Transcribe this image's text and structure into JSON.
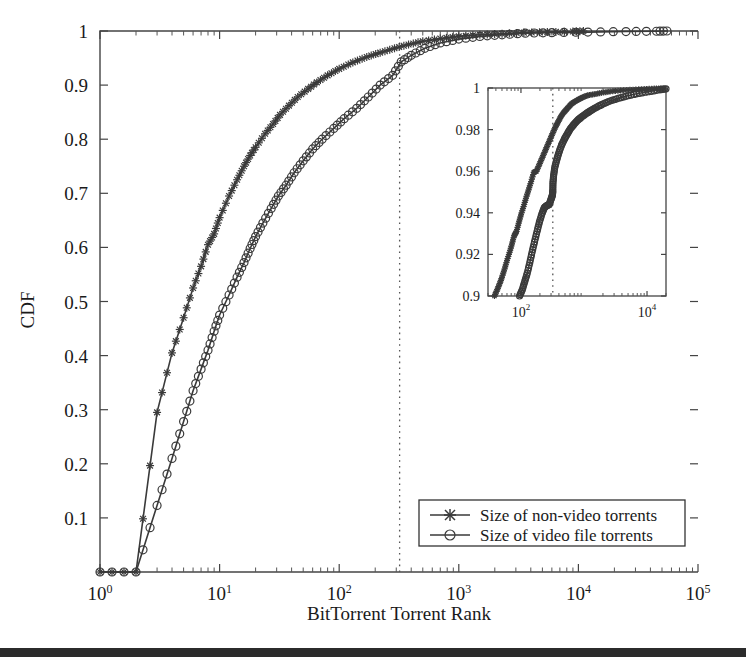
{
  "figure": {
    "background_color": "#ffffff",
    "line_color": "#3a3a3a",
    "axis_color": "#444444",
    "scan_bar": {
      "top": 648,
      "height": 9,
      "color": "#2b2b2b"
    }
  },
  "chart_data": {
    "type": "line",
    "title": "",
    "xlabel": "BitTorrent Torrent Rank",
    "ylabel": "CDF",
    "xscale": "log",
    "yscale": "linear",
    "xlim": [
      1,
      100000
    ],
    "ylim": [
      0,
      1
    ],
    "grid": false,
    "xtick_labels": [
      "10^0",
      "10^1",
      "10^2",
      "10^3",
      "10^4",
      "10^5"
    ],
    "xtick_values": [
      1,
      10,
      100,
      1000,
      10000,
      100000
    ],
    "ytick_labels": [
      "0.1",
      "0.2",
      "0.3",
      "0.4",
      "0.5",
      "0.6",
      "0.7",
      "0.8",
      "0.9",
      "1"
    ],
    "ytick_values": [
      0.1,
      0.2,
      0.3,
      0.4,
      0.5,
      0.6,
      0.7,
      0.8,
      0.9,
      1.0
    ],
    "legend_position": "lower right",
    "annotations": [
      {
        "name": "vertical-dotted-guide",
        "type": "vline",
        "x": 320
      }
    ],
    "series": [
      {
        "name": "Size of non-video torrents",
        "marker": "star",
        "x": [
          1,
          2,
          3,
          4,
          5,
          6,
          7,
          8,
          9,
          10,
          12,
          14,
          16,
          18,
          20,
          24,
          28,
          32,
          38,
          45,
          55,
          65,
          80,
          100,
          130,
          170,
          220,
          290,
          380,
          500,
          700,
          1000,
          1500,
          2300,
          3500,
          5500,
          9000,
          11000
        ],
        "y": [
          0.0,
          0.0,
          0.295,
          0.405,
          0.47,
          0.525,
          0.565,
          0.605,
          0.625,
          0.655,
          0.695,
          0.725,
          0.75,
          0.77,
          0.785,
          0.81,
          0.828,
          0.845,
          0.862,
          0.878,
          0.893,
          0.905,
          0.918,
          0.93,
          0.942,
          0.952,
          0.96,
          0.968,
          0.975,
          0.981,
          0.986,
          0.99,
          0.993,
          0.995,
          0.997,
          0.998,
          0.999,
          1.0
        ]
      },
      {
        "name": "Size of video file torrents",
        "marker": "circle",
        "x": [
          1,
          2,
          3,
          4,
          5,
          6,
          7,
          8,
          9,
          10,
          12,
          14,
          16,
          18,
          20,
          23,
          27,
          31,
          36,
          42,
          50,
          60,
          72,
          90,
          110,
          140,
          175,
          220,
          280,
          330,
          400,
          520,
          700,
          1000,
          1500,
          2300,
          3600,
          6000,
          12000,
          25000,
          45000,
          55000
        ],
        "y": [
          0.0,
          0.0,
          0.123,
          0.21,
          0.278,
          0.335,
          0.375,
          0.41,
          0.445,
          0.475,
          0.512,
          0.545,
          0.572,
          0.598,
          0.62,
          0.645,
          0.672,
          0.695,
          0.715,
          0.738,
          0.76,
          0.782,
          0.8,
          0.82,
          0.838,
          0.857,
          0.878,
          0.9,
          0.918,
          0.943,
          0.955,
          0.968,
          0.978,
          0.985,
          0.99,
          0.993,
          0.996,
          0.997,
          0.998,
          0.999,
          0.9995,
          1.0
        ]
      }
    ],
    "inset": {
      "xlabel": "",
      "ylabel": "",
      "xscale": "log",
      "xlim": [
        30,
        20000
      ],
      "ylim": [
        0.9,
        1.0
      ],
      "xtick_labels": [
        "10^2",
        "10^4"
      ],
      "xtick_values": [
        100,
        10000
      ],
      "ytick_labels": [
        "0.9",
        "0.92",
        "0.94",
        "0.96",
        "0.98",
        "1"
      ],
      "ytick_values": [
        0.9,
        0.92,
        0.94,
        0.96,
        0.98,
        1.0
      ],
      "annotations": [
        {
          "name": "vertical-dotted-guide",
          "type": "vline",
          "x": 320
        }
      ],
      "series": [
        {
          "name": "Size of non-video torrents",
          "marker": "star",
          "x": [
            38,
            42,
            46,
            50,
            55,
            60,
            66,
            72,
            78,
            85,
            92,
            100,
            110,
            120,
            132,
            145,
            160,
            176,
            194,
            214,
            236,
            260,
            287,
            316,
            349,
            385,
            425,
            470,
            520,
            575,
            640,
            720,
            820,
            950,
            1150,
            1450,
            1900,
            2600,
            3800,
            6000,
            9000,
            13000,
            18000
          ],
          "y": [
            0.9,
            0.903,
            0.906,
            0.909,
            0.913,
            0.917,
            0.921,
            0.925,
            0.929,
            0.931,
            0.935,
            0.939,
            0.943,
            0.947,
            0.951,
            0.955,
            0.9595,
            0.96,
            0.963,
            0.966,
            0.969,
            0.972,
            0.975,
            0.978,
            0.981,
            0.9835,
            0.986,
            0.988,
            0.9895,
            0.991,
            0.9925,
            0.9935,
            0.9945,
            0.9955,
            0.9965,
            0.997,
            0.9977,
            0.9983,
            0.9988,
            0.9992,
            0.9995,
            0.9997,
            0.9999
          ]
        },
        {
          "name": "Size of video file torrents",
          "marker": "circle",
          "x": [
            95,
            105,
            115,
            126,
            138,
            150,
            164,
            180,
            196,
            215,
            235,
            257,
            281,
            300,
            316,
            320,
            322,
            330,
            345,
            370,
            400,
            440,
            490,
            545,
            610,
            690,
            790,
            910,
            1060,
            1260,
            1520,
            1900,
            2450,
            3300,
            4600,
            6800,
            10500,
            16000,
            20000
          ],
          "y": [
            0.9,
            0.903,
            0.907,
            0.911,
            0.916,
            0.921,
            0.926,
            0.931,
            0.9355,
            0.9395,
            0.9425,
            0.9435,
            0.944,
            0.9465,
            0.9485,
            0.9505,
            0.9545,
            0.958,
            0.962,
            0.9655,
            0.969,
            0.9725,
            0.9755,
            0.978,
            0.9805,
            0.9825,
            0.9845,
            0.986,
            0.9875,
            0.989,
            0.9905,
            0.992,
            0.9935,
            0.9948,
            0.996,
            0.9972,
            0.9982,
            0.9991,
            0.9996
          ]
        }
      ]
    }
  },
  "legend": {
    "items": [
      {
        "label": "Size of non-video torrents",
        "marker": "star"
      },
      {
        "label": "Size of video file torrents",
        "marker": "circle"
      }
    ]
  }
}
